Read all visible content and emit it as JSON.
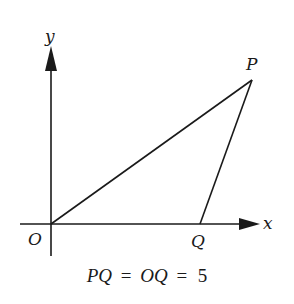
{
  "diagram": {
    "type": "coordinate-geometry",
    "axes": {
      "x_label": "x",
      "y_label": "y",
      "origin_label": "O"
    },
    "points": [
      {
        "id": "O",
        "label": "O"
      },
      {
        "id": "P",
        "label": "P"
      },
      {
        "id": "Q",
        "label": "Q"
      }
    ],
    "segments": [
      "OP",
      "PQ"
    ],
    "caption": {
      "lhs1": "PQ",
      "eq1": "=",
      "lhs2": "OQ",
      "eq2": "=",
      "value": "5"
    }
  },
  "colors": {
    "stroke": "#1a1a1a",
    "background": "#ffffff"
  }
}
